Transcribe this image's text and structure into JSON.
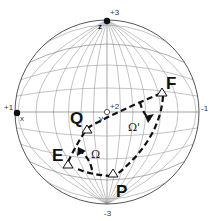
{
  "diagram": {
    "type": "wulff-net-stereographic-projection",
    "axis_labels": {
      "top": "+3",
      "bottom": "-3",
      "left": "+1",
      "right": "-1",
      "center": "+2"
    },
    "axis_names": {
      "z": "z",
      "x": "x",
      "y": "y"
    },
    "points": {
      "Q": "Q",
      "F": "F",
      "E": "E",
      "P": "P"
    },
    "angles": {
      "omega": "Ω",
      "omega_prime": "Ω'"
    },
    "colors": {
      "grid": "#999999",
      "line": "#111111",
      "background": "#ffffff"
    }
  }
}
